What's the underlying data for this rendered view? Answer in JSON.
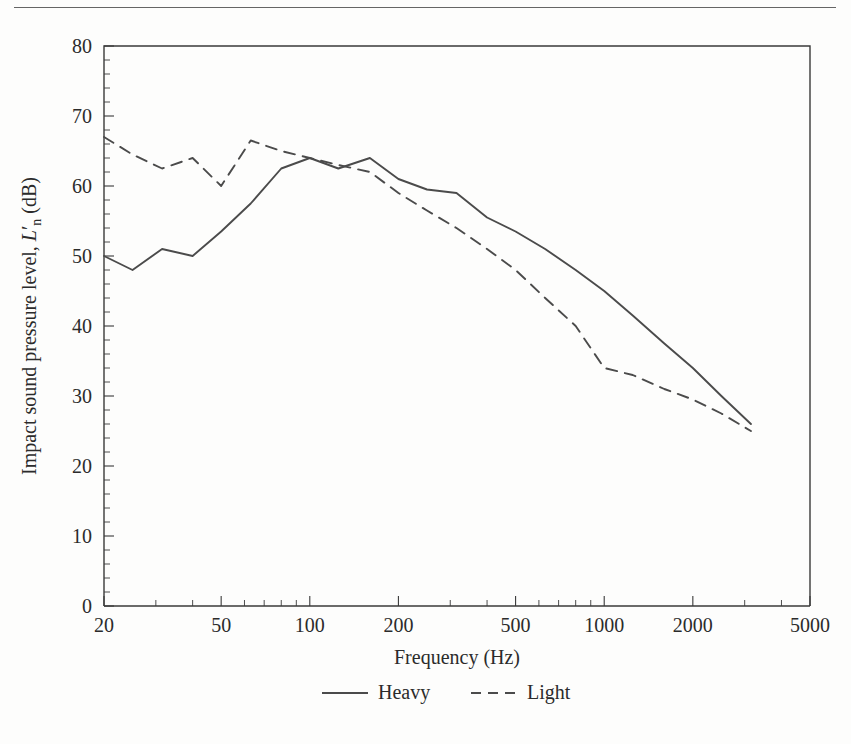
{
  "page": {
    "background_color": "#fdfdfc",
    "ink_color": "#2b2b2b",
    "has_top_rule": true
  },
  "chart_data": {
    "type": "line",
    "title": "",
    "xlabel": "Frequency (Hz)",
    "ylabel": "Impact sound pressure level, L'n (dB)",
    "ylabel_parts": {
      "prefix": "Impact sound pressure level, ",
      "symbol": "L",
      "prime": "′",
      "subscript": "n",
      "suffix": " (dB)"
    },
    "xscale": "log",
    "yscale": "linear",
    "xlim": [
      20,
      5000
    ],
    "ylim": [
      0,
      80
    ],
    "xticks": [
      20,
      50,
      100,
      200,
      500,
      1000,
      2000,
      5000
    ],
    "xtick_labels": [
      "20",
      "50",
      "100",
      "200",
      "500",
      "1000",
      "2000",
      "5000"
    ],
    "yticks": [
      0,
      10,
      20,
      30,
      40,
      50,
      60,
      70,
      80
    ],
    "ytick_labels": [
      "0",
      "10",
      "20",
      "30",
      "40",
      "50",
      "60",
      "70",
      "80"
    ],
    "ytick_minor_step": 2,
    "grid": false,
    "legend_position": "below-axes",
    "series": [
      {
        "name": "Heavy",
        "style": "solid",
        "color": "#4b4b4b",
        "x": [
          20,
          25,
          31.5,
          40,
          50,
          63,
          80,
          100,
          125,
          160,
          200,
          250,
          315,
          400,
          500,
          630,
          800,
          1000,
          1250,
          1600,
          2000,
          2500,
          3150
        ],
        "values": [
          50,
          48,
          51,
          50,
          53.5,
          57.5,
          62.5,
          64,
          62.5,
          64,
          61,
          59.5,
          59,
          55.5,
          53.5,
          51,
          48,
          45,
          41.5,
          37.5,
          34,
          30,
          26
        ]
      },
      {
        "name": "Light",
        "style": "dashed",
        "color": "#4b4b4b",
        "x": [
          20,
          25,
          31.5,
          40,
          50,
          63,
          80,
          100,
          125,
          160,
          200,
          250,
          315,
          400,
          500,
          630,
          800,
          1000,
          1250,
          1600,
          2000,
          2500,
          3150
        ],
        "values": [
          67,
          64.5,
          62.5,
          64,
          60,
          66.5,
          65,
          64,
          63,
          62,
          59,
          56.5,
          54,
          51,
          48,
          44,
          40,
          34,
          33,
          31,
          29.5,
          27.5,
          25
        ]
      }
    ]
  },
  "legend": {
    "items": [
      {
        "label": "Heavy",
        "style": "solid"
      },
      {
        "label": "Light",
        "style": "dashed"
      }
    ]
  }
}
